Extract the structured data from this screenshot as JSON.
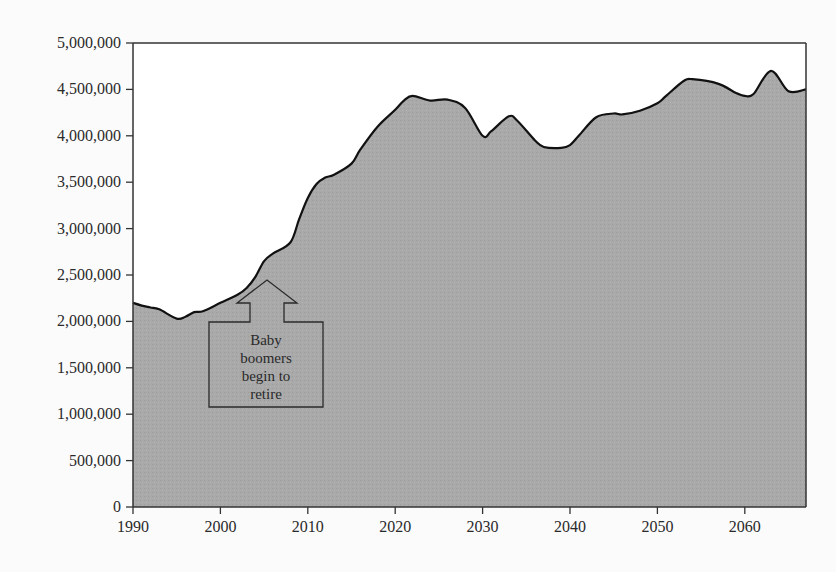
{
  "chart_data": {
    "type": "area",
    "title": "",
    "xlabel": "",
    "ylabel": "",
    "xlim": [
      1990,
      2067
    ],
    "ylim": [
      0,
      5000000
    ],
    "grid": false,
    "legend": null,
    "fill_color": "#a9a9a9",
    "line_color": "#111111",
    "y_ticks": [
      0,
      500000,
      1000000,
      1500000,
      2000000,
      2500000,
      3000000,
      3500000,
      4000000,
      4500000,
      5000000
    ],
    "y_tick_labels": [
      "0",
      "500,000",
      "1,000,000",
      "1,500,000",
      "2,000,000",
      "2,500,000",
      "3,000,000",
      "3,500,000",
      "4,000,000",
      "4,500,000",
      "5,000,000"
    ],
    "x_ticks": [
      1990,
      2000,
      2010,
      2020,
      2030,
      2040,
      2050,
      2060
    ],
    "x_tick_labels": [
      "1990",
      "2000",
      "2010",
      "2020",
      "2030",
      "2040",
      "2050",
      "2060"
    ],
    "series": [
      {
        "name": "Retirements",
        "x": [
          1990,
          1991,
          1992,
          1993,
          1995,
          1996,
          1997,
          1998,
          2000,
          2002,
          2003,
          2004,
          2005,
          2006,
          2008,
          2009,
          2010,
          2011,
          2012,
          2013,
          2015,
          2016,
          2018,
          2020,
          2021,
          2022,
          2024,
          2026,
          2028,
          2030,
          2031,
          2033,
          2034,
          2036,
          2037,
          2039,
          2040,
          2041,
          2043,
          2045,
          2046,
          2048,
          2050,
          2051,
          2053,
          2054,
          2057,
          2059,
          2060,
          2061,
          2063,
          2065,
          2067
        ],
        "values": [
          2200000,
          2170000,
          2150000,
          2130000,
          2030000,
          2050000,
          2100000,
          2110000,
          2200000,
          2290000,
          2360000,
          2480000,
          2650000,
          2730000,
          2850000,
          3100000,
          3330000,
          3480000,
          3550000,
          3580000,
          3700000,
          3850000,
          4100000,
          4280000,
          4380000,
          4430000,
          4380000,
          4390000,
          4300000,
          4000000,
          4050000,
          4210000,
          4160000,
          3950000,
          3880000,
          3870000,
          3900000,
          4000000,
          4200000,
          4240000,
          4230000,
          4270000,
          4350000,
          4430000,
          4590000,
          4610000,
          4560000,
          4460000,
          4430000,
          4450000,
          4700000,
          4480000,
          4500000
        ]
      }
    ],
    "annotations": [
      {
        "text": "Baby boomers begin to retire",
        "lines": [
          "Baby",
          "boomers",
          "begin to",
          "retire"
        ],
        "x": 2008,
        "shape": "up-arrow-callout"
      }
    ]
  }
}
